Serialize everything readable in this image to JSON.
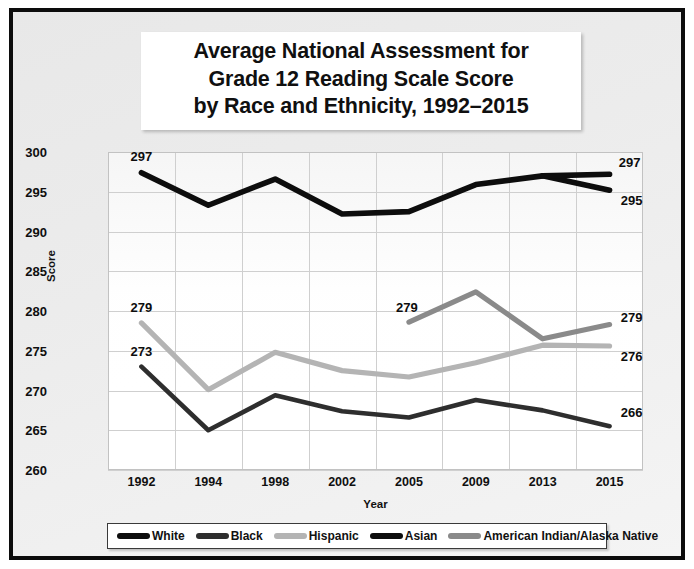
{
  "title": {
    "line1": "Average National Assessment for",
    "line2": "Grade 12 Reading Scale Score",
    "line3": "by Race and Ethnicity, 1992–2015"
  },
  "colors": {
    "white_series": "#0d0d0d",
    "black_series": "#2e2e2e",
    "hispanic_series": "#b4b4b4",
    "asian_series": "#0d0d0d",
    "aian_series": "#8a8a8a",
    "frame": "#0c0c0c",
    "gridline": "#cfcfcf",
    "panel_background": "#ececec"
  },
  "legend": {
    "position": "bottom",
    "items": [
      {
        "label": "White",
        "color": "#0d0d0d"
      },
      {
        "label": "Black",
        "color": "#2e2e2e"
      },
      {
        "label": "Hispanic",
        "color": "#b4b4b4"
      },
      {
        "label": "Asian",
        "color": "#0d0d0d"
      },
      {
        "label": "American Indian/Alaska Native",
        "color": "#8a8a8a"
      }
    ]
  },
  "chart_data": {
    "type": "line",
    "title": "Average National Assessment for Grade 12 Reading Scale Score by Race and Ethnicity, 1992–2015",
    "xlabel": "Year",
    "ylabel": "Score",
    "categories": [
      "1992",
      "1994",
      "1998",
      "2002",
      "2005",
      "2009",
      "2013",
      "2015"
    ],
    "ylim": [
      260,
      300
    ],
    "yticks": [
      260,
      265,
      270,
      275,
      280,
      285,
      290,
      295,
      300
    ],
    "grid": true,
    "series": [
      {
        "name": "White",
        "color": "#0d0d0d",
        "values": [
          297.4,
          293.3,
          296.6,
          292.2,
          292.5,
          295.9,
          297.0,
          295.2
        ]
      },
      {
        "name": "Black",
        "color": "#2e2e2e",
        "values": [
          273.0,
          265.0,
          269.4,
          267.4,
          266.6,
          268.8,
          267.5,
          265.5
        ]
      },
      {
        "name": "Hispanic",
        "color": "#b4b4b4",
        "values": [
          278.5,
          270.1,
          274.8,
          272.5,
          271.7,
          273.5,
          275.7,
          275.6
        ]
      },
      {
        "name": "Asian",
        "color": "#0d0d0d",
        "values": [
          null,
          null,
          null,
          null,
          null,
          null,
          297.0,
          297.2
        ]
      },
      {
        "name": "American Indian/Alaska Native",
        "color": "#8a8a8a",
        "values": [
          null,
          null,
          null,
          null,
          278.6,
          282.4,
          276.5,
          278.3
        ]
      }
    ],
    "annotations": [
      {
        "text": "297",
        "series": "White",
        "category": "1992",
        "value": 297.4
      },
      {
        "text": "273",
        "series": "Black",
        "category": "1992",
        "value": 273.0
      },
      {
        "text": "279",
        "series": "Hispanic",
        "category": "1992",
        "value": 278.5
      },
      {
        "text": "279",
        "series": "American Indian/Alaska Native",
        "category": "2005",
        "value": 278.6
      },
      {
        "text": "297",
        "series": "Asian",
        "category": "2015",
        "value": 297.2
      },
      {
        "text": "295",
        "series": "White",
        "category": "2015",
        "value": 295.2
      },
      {
        "text": "279",
        "series": "American Indian/Alaska Native",
        "category": "2015",
        "value": 278.3
      },
      {
        "text": "276",
        "series": "Hispanic",
        "category": "2015",
        "value": 275.6
      },
      {
        "text": "266",
        "series": "Black",
        "category": "2015",
        "value": 265.5
      }
    ]
  }
}
